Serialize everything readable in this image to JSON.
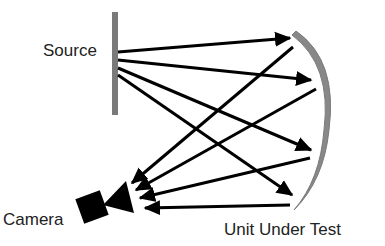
{
  "labels": {
    "source": "Source",
    "camera": "Camera",
    "unit_under_test": "Unit Under Test"
  },
  "colors": {
    "ray": "#000000",
    "source_bar": "#7a7a7a",
    "mirror": "#808080",
    "camera": "#000000",
    "text": "#222222"
  },
  "components": {
    "source": {
      "x": 112,
      "y": 12,
      "width": 6,
      "height": 103
    },
    "mirror": {
      "top": [
        296,
        32
      ],
      "bottom": [
        295,
        208
      ],
      "bulge_x": 332
    },
    "camera": {
      "center": [
        92,
        207
      ],
      "size": 26,
      "rotation_deg": -20,
      "lens": [
        [
          103,
          205
        ],
        [
          126,
          181
        ],
        [
          134,
          213
        ]
      ]
    }
  },
  "rays_incident": [
    {
      "from": [
        118,
        52
      ],
      "to": [
        297,
        37
      ]
    },
    {
      "from": [
        118,
        60
      ],
      "to": [
        318,
        82
      ]
    },
    {
      "from": [
        118,
        68
      ],
      "to": [
        318,
        152
      ]
    },
    {
      "from": [
        118,
        75
      ],
      "to": [
        298,
        199
      ]
    }
  ],
  "rays_reflected": [
    {
      "from": [
        293,
        47
      ],
      "to": [
        127,
        187
      ]
    },
    {
      "from": [
        316,
        89
      ],
      "to": [
        131,
        193
      ]
    },
    {
      "from": [
        310,
        158
      ],
      "to": [
        135,
        200
      ]
    },
    {
      "from": [
        290,
        205
      ],
      "to": [
        139,
        208
      ]
    }
  ]
}
